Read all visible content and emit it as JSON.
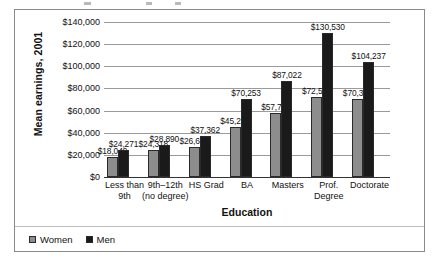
{
  "chart_data": {
    "type": "bar",
    "title": "",
    "xlabel": "Education",
    "ylabel": "Mean earnings, 2001",
    "ylim": [
      0,
      140000
    ],
    "ytick_step": 20000,
    "grid": true,
    "legend_position": "bottom-left",
    "categories": [
      "Less than\n9th",
      "9th–12th\n(no degree)",
      "HS Grad",
      "BA",
      "Masters",
      "Prof.\nDegree",
      "Doctorate"
    ],
    "ytick_labels": [
      "$0",
      "$20,000",
      "$40,000",
      "$60,000",
      "$80,000",
      "$100,000",
      "$120,000",
      "$140,000"
    ],
    "series": [
      {
        "name": "Women",
        "color": "#8d8d8d",
        "values": [
          18049,
          24318,
          26690,
          45290,
          57700,
          72568,
          70302
        ],
        "labels": [
          "$18,049",
          "$24,318",
          "$26,690",
          "$45,290",
          "$57,700",
          "$72,568",
          "$70,302"
        ]
      },
      {
        "name": "Men",
        "color": "#1a1a1a",
        "values": [
          24271,
          28890,
          37362,
          70253,
          87022,
          130530,
          104237
        ],
        "labels": [
          "$24,271",
          "$28,890",
          "$37,362",
          "$70,253",
          "$87,022",
          "$130,530",
          "$104,237"
        ]
      }
    ]
  },
  "legend": {
    "items": [
      {
        "label": "Women",
        "swatch": "women"
      },
      {
        "label": "Men",
        "swatch": "men"
      }
    ]
  }
}
